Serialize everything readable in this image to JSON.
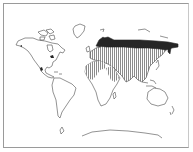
{
  "map": {
    "type": "world-distribution-map",
    "projection": "world outline",
    "legend": [],
    "regions": [
      {
        "name": "northern-eurasia-dark",
        "fill": "#2a2a2a",
        "pattern": "solid"
      },
      {
        "name": "eurasia-africa-hatched",
        "fill": "#8a8a8a",
        "pattern": "vertical-hatch"
      }
    ],
    "colors": {
      "outline": "#4a4a4a",
      "dark_fill": "#262626",
      "hatch": "#7a7a7a",
      "background": "#ffffff",
      "frame": "#9a9a9a"
    }
  }
}
